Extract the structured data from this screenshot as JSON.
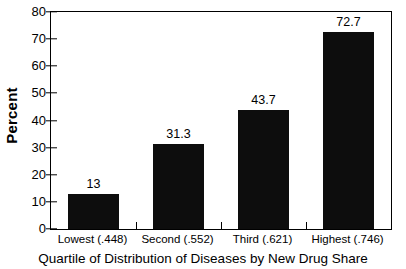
{
  "chart_data": {
    "type": "bar",
    "title": "",
    "categories": [
      "Lowest (.448)",
      "Second (.552)",
      "Third (.621)",
      "Highest (.746)"
    ],
    "values": [
      13,
      31.3,
      43.7,
      72.7
    ],
    "value_labels": [
      "13",
      "31.3",
      "43.7",
      "72.7"
    ],
    "xlabel": "Quartile of Distribution of Diseases by New Drug Share",
    "ylabel": "Percent",
    "ylim": [
      0,
      80
    ],
    "ytick_labels": [
      "0",
      "10",
      "20",
      "30",
      "40",
      "50",
      "60",
      "70",
      "80"
    ],
    "ytick_values": [
      0,
      10,
      20,
      30,
      40,
      50,
      60,
      70,
      80
    ],
    "grid": false,
    "legend": false,
    "bar_color": "#0d0d0d",
    "axis_color": "#000000",
    "background_color": "#ffffff"
  }
}
